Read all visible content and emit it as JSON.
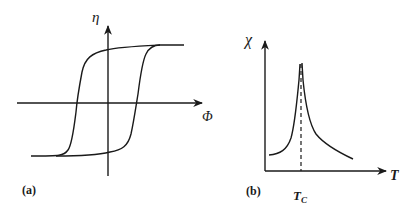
{
  "panel_a": {
    "label": "(a)",
    "y_axis_label": "η",
    "x_axis_label": "Φ",
    "description": "Hysteresis loop: order parameter η vs field Φ"
  },
  "panel_b": {
    "label": "(b)",
    "y_axis_label": "χ",
    "x_axis_label": "T",
    "tc_label_main": "T",
    "tc_label_sub": "C",
    "description": "Susceptibility χ diverges at Curie temperature T_C"
  },
  "colors": {
    "ink": "#1a1a1a",
    "background": "#ffffff"
  }
}
